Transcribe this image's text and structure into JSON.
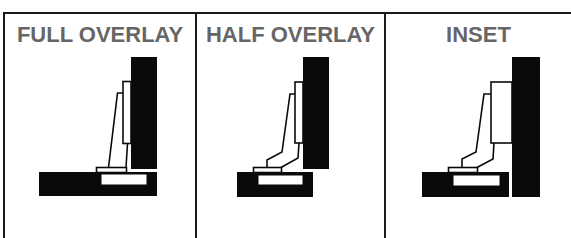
{
  "panels": [
    {
      "title": "FULL OVERLAY"
    },
    {
      "title": "HALF OVERLAY"
    },
    {
      "title": "INSET"
    }
  ],
  "colors": {
    "title_text": "#666666",
    "lines": "#1a1a1a",
    "fill_black": "#0a0a0a",
    "background": "#ffffff"
  }
}
